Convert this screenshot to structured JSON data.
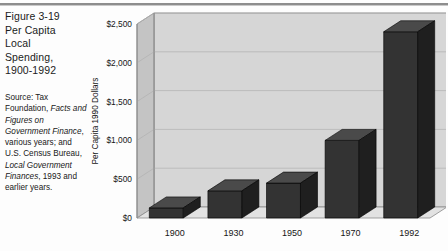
{
  "figure": {
    "title_lines": [
      "Figure 3-19",
      "Per Capita",
      "Local",
      "Spending,",
      "1900-1992"
    ],
    "title_full": "Figure 3-19 Per Capita Local Spending, 1900-1992",
    "source_segments": [
      {
        "text": "Source: Tax Foundation, ",
        "italic": false
      },
      {
        "text": "Facts and Figures on Government Finance",
        "italic": true
      },
      {
        "text": ", various years; and U.S. Census Bureau, ",
        "italic": false
      },
      {
        "text": "Local Government Finances",
        "italic": true
      },
      {
        "text": ", 1993 and earlier years.",
        "italic": false
      }
    ],
    "source_plain": "Source: Tax Foundation, Facts and Figures on Government Finance, various years; and U.S. Census Bureau, Local Government Finances, 1993 and earlier years."
  },
  "colors": {
    "bar_front": "#333333",
    "bar_top": "#4a4a4a",
    "bar_side": "#1f1f1f",
    "back_wall": "#d6d6d6",
    "side_wall": "#c4c4c4",
    "floor": "#e2e2e2",
    "gridline": "#b0b0b0",
    "outline": "#8a8a8a",
    "text": "#161616",
    "rule": "#8d8d8d"
  },
  "chart_data": {
    "type": "bar",
    "subtitle": "",
    "xlabel": "",
    "ylabel": "Per Capita 1990 Dollars",
    "categories": [
      "1900",
      "1930",
      "1950",
      "1970",
      "1992"
    ],
    "values": [
      130,
      350,
      450,
      1000,
      2400
    ],
    "ylim": [
      0,
      2500
    ],
    "ytick_values": [
      0,
      500,
      1000,
      1500,
      2000,
      2500
    ],
    "ytick_labels": [
      "$0",
      "$500",
      "$1,000",
      "$1,500",
      "$2,000",
      "$2,500"
    ],
    "grid": true,
    "legend": false,
    "legend_position": "none",
    "three_d": true,
    "annotations": []
  }
}
